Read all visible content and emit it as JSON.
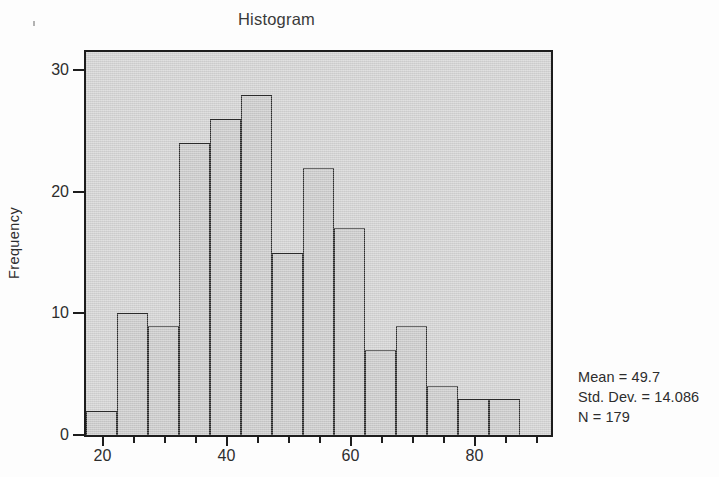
{
  "chart_data": {
    "type": "bar",
    "title": "Histogram",
    "xlabel": "",
    "ylabel": "Frequency",
    "xlim": [
      17.5,
      92.5
    ],
    "ylim": [
      0,
      31.5
    ],
    "grid": false,
    "legend": null,
    "bin_width": 5,
    "bin_edges": [
      17.5,
      22.5,
      27.5,
      32.5,
      37.5,
      42.5,
      47.5,
      52.5,
      57.5,
      62.5,
      67.5,
      72.5,
      77.5,
      82.5,
      87.5,
      92.5
    ],
    "bin_centers": [
      20,
      25,
      30,
      35,
      40,
      45,
      50,
      55,
      60,
      65,
      70,
      75,
      80,
      85,
      90
    ],
    "values": [
      2,
      10,
      9,
      24,
      26,
      28,
      15,
      22,
      17,
      7,
      9,
      4,
      3,
      3,
      0
    ],
    "categories": [
      "17.5-22.5",
      "22.5-27.5",
      "27.5-32.5",
      "32.5-37.5",
      "37.5-42.5",
      "42.5-47.5",
      "47.5-52.5",
      "52.5-57.5",
      "57.5-62.5",
      "62.5-67.5",
      "67.5-72.5",
      "72.5-77.5",
      "77.5-82.5",
      "82.5-87.5",
      "87.5-92.5"
    ],
    "y_ticks": [
      0,
      10,
      20,
      30
    ],
    "y_tick_labels": [
      "0",
      "10",
      "20",
      "30"
    ],
    "x_ticks_major": [
      20,
      40,
      60,
      80
    ],
    "x_tick_labels_major": [
      "20",
      "40",
      "60",
      "80"
    ],
    "x_ticks_minor": [
      25,
      30,
      35,
      45,
      50,
      55,
      65,
      70,
      75,
      85,
      90
    ],
    "annotations": {
      "mean": "Mean = 49.7",
      "std_dev": "Std. Dev. = 14.086",
      "n": "N = 179"
    },
    "colors": {
      "panel_background": "#d2d2d2",
      "bar_fill": "#cacaca",
      "bar_outline": "#2a2a2a",
      "axis": "#1d1d1d",
      "text": "#2d2d2d",
      "page_background": "#fdfdfd"
    }
  },
  "chart": {
    "title": "Histogram",
    "y_axis_title": "Frequency"
  },
  "stats": {
    "line1": "Mean = 49.7",
    "line2": "Std. Dev. = 14.086",
    "line3": "N = 179"
  }
}
